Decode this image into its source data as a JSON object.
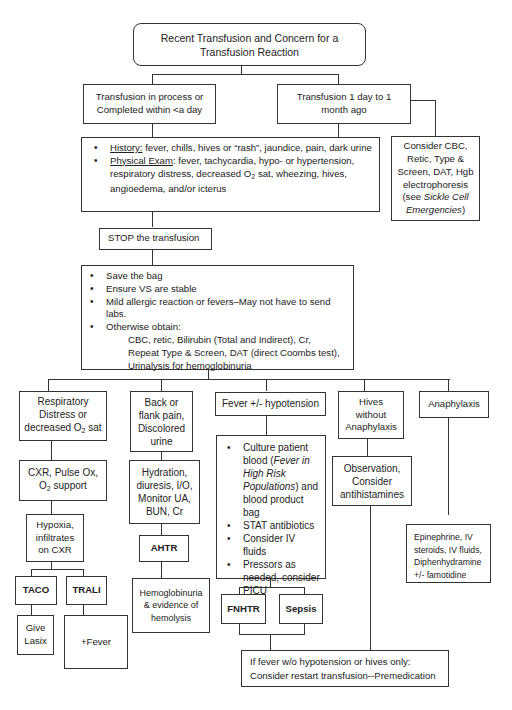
{
  "diagram": {
    "root": {
      "line1": "Recent Transfusion and Concern for a",
      "line2": "Transfusion Reaction"
    },
    "branch_left": {
      "line1": "Transfusion in process or",
      "line2": "Completed within <a day"
    },
    "branch_right": {
      "line1": "Transfusion 1 day to 1",
      "line2": "month ago"
    },
    "history_box": {
      "history_label": "History:",
      "history_text": " fever, chills, hives or “rash”, jaundice, pain, dark urine",
      "exam_label": "Physical Exam",
      "exam_text1": ": fever, tachycardia, hypo- or hypertension,",
      "exam_text2a": "respiratory distress, decreased O",
      "exam_sub": "2",
      "exam_text2b": " sat, wheezing, hives,",
      "exam_text3": "angioedema, and/or icterus"
    },
    "sickle_box": {
      "l1": "Consider CBC,",
      "l2": "Retic, Type &",
      "l3": "Screen, DAT, Hgb",
      "l4": "electrophoresis",
      "l5a": "(see ",
      "l5b": "Sickle Cell",
      "l6a": "Emergencies",
      "l6b": ")"
    },
    "stop_box": "STOP the transfusion",
    "actions_box": {
      "items": [
        "Save the bag",
        "Ensure VS are stable",
        "Mild allergic reaction or fevers–May not have to send labs.",
        "Otherwise obtain:"
      ],
      "labs": [
        "CBC, retic, Bilirubin (Total and Indirect), Cr,",
        "Repeat Type & Screen, DAT (direct Coombs test),",
        "Urinalysis for hemoglobinuria"
      ]
    },
    "resp": {
      "title1": "Respiratory",
      "title2": "Distress or",
      "title3a": "decreased O",
      "title3sub": "2",
      "title3b": " sat",
      "action1": "CXR, Pulse Ox,",
      "action2a": "O",
      "action2sub": "2",
      "action2b": " support",
      "hypoxia1": "Hypoxia,",
      "hypoxia2": "infiltrates",
      "hypoxia3": "on CXR",
      "taco": "TACO",
      "trali": "TRALI",
      "taco_action1": "Give",
      "taco_action2": "Lasix",
      "trali_action": "+Fever"
    },
    "back": {
      "title1": "Back or",
      "title2": "flank pain,",
      "title3": "Discolored",
      "title4": "urine",
      "action1": "Hydration,",
      "action2": "diuresis, I/O,",
      "action3": "Monitor UA,",
      "action4": "BUN, Cr",
      "ahtr": "AHTR",
      "result1": "Hemoglobinuria",
      "result2": "& evidence of",
      "result3": "hemolysis"
    },
    "fever": {
      "title": "Fever +/- hypotension",
      "b1a": "Culture patient blood (",
      "b1b": "Fever in High Risk Populations",
      "b1c": ") and blood product bag",
      "b2": "STAT antibiotics",
      "b3": "Consider IV fluids",
      "b4": "Pressors as needed, consider PICU",
      "fnhtr": "FNHTR",
      "sepsis": "Sepsis"
    },
    "hives": {
      "title1": "Hives",
      "title2": "without",
      "title3": "Anaphylaxis",
      "action1": "Observation,",
      "action2": "Consider",
      "action3": "antihistamines"
    },
    "anaphylaxis": {
      "title": "Anaphylaxis",
      "action1": "Epinephrine, IV",
      "action2": "steroids, IV fluids,",
      "action3": "Diphenhydramine",
      "action4": "+/- famotidine"
    },
    "restart_box": {
      "line1": "If fever w/o hypotension or hives only:",
      "line2": "Consider restart transfusion--Premedication"
    }
  }
}
